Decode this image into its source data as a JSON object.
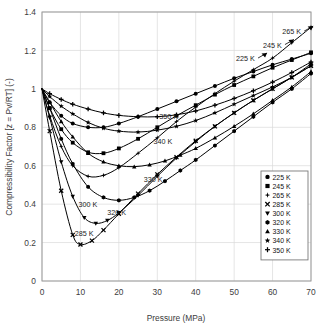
{
  "chart_data": {
    "type": "line",
    "title": "",
    "xlabel": "Pressure (MPa)",
    "ylabel": "Compressibility Factor [z = Pv/RT] (-)",
    "xlim": [
      0,
      70
    ],
    "ylim": [
      0,
      1.4
    ],
    "xticks": [
      "0",
      "10",
      "20",
      "30",
      "40",
      "50",
      "60",
      "70"
    ],
    "xtick_values": [
      0,
      10,
      20,
      30,
      40,
      50,
      60,
      70
    ],
    "yticks": [
      "0",
      "0.2",
      "0.4",
      "0.6",
      "0.8",
      "1",
      "1.2",
      "1.4"
    ],
    "ytick_values": [
      0,
      0.2,
      0.4,
      0.6,
      0.8,
      1.0,
      1.2,
      1.4
    ],
    "grid": true,
    "legend_position": "right-lower",
    "series": [
      {
        "name": "225 K",
        "marker": "circle",
        "x": [
          0,
          2,
          5,
          8,
          12,
          16,
          20,
          25,
          30,
          35,
          40,
          45,
          50,
          55,
          60,
          65,
          70
        ],
        "values": [
          1.0,
          0.93,
          0.86,
          0.82,
          0.8,
          0.8,
          0.82,
          0.855,
          0.895,
          0.935,
          0.975,
          1.015,
          1.055,
          1.09,
          1.125,
          1.155,
          1.185
        ]
      },
      {
        "name": "245 K",
        "marker": "square",
        "x": [
          0,
          2,
          5,
          8,
          12,
          16,
          20,
          25,
          30,
          35,
          40,
          45,
          50,
          55,
          60,
          65,
          70
        ],
        "values": [
          1.0,
          0.9,
          0.79,
          0.72,
          0.67,
          0.665,
          0.69,
          0.74,
          0.8,
          0.86,
          0.915,
          0.97,
          1.02,
          1.065,
          1.11,
          1.15,
          1.19
        ]
      },
      {
        "name": "265 K",
        "marker": "star4",
        "x": [
          0,
          2,
          5,
          8,
          12,
          16,
          20,
          25,
          30,
          35,
          40,
          45,
          50,
          55,
          60,
          65,
          70
        ],
        "values": [
          1.0,
          0.86,
          0.7,
          0.6,
          0.545,
          0.55,
          0.59,
          0.665,
          0.745,
          0.83,
          0.905,
          0.975,
          1.04,
          1.1,
          1.16,
          1.24,
          1.32
        ]
      },
      {
        "name": "285 K",
        "marker": "cross",
        "x": [
          0,
          2,
          5,
          8,
          10,
          13,
          16,
          20,
          25,
          30,
          35,
          40,
          45,
          50,
          55,
          60,
          65,
          70
        ],
        "values": [
          1.0,
          0.78,
          0.47,
          0.24,
          0.19,
          0.21,
          0.265,
          0.35,
          0.455,
          0.555,
          0.645,
          0.73,
          0.805,
          0.875,
          0.94,
          1.0,
          1.06,
          1.12
        ]
      },
      {
        "name": "300 K",
        "marker": "triangle-down",
        "x": [
          0,
          2,
          5,
          8,
          11,
          14,
          17,
          20,
          25,
          30,
          35,
          40,
          45,
          50,
          55,
          60,
          65,
          70
        ],
        "values": [
          1.0,
          0.85,
          0.62,
          0.44,
          0.33,
          0.3,
          0.315,
          0.355,
          0.445,
          0.545,
          0.64,
          0.725,
          0.805,
          0.875,
          0.94,
          1.0,
          1.06,
          1.13
        ]
      },
      {
        "name": "320 K",
        "marker": "hexagon",
        "x": [
          0,
          2,
          5,
          8,
          12,
          16,
          20,
          24,
          28,
          32,
          36,
          40,
          45,
          50,
          55,
          60,
          65,
          70
        ],
        "values": [
          1.0,
          0.9,
          0.74,
          0.61,
          0.49,
          0.435,
          0.42,
          0.435,
          0.47,
          0.52,
          0.575,
          0.63,
          0.705,
          0.78,
          0.855,
          0.93,
          1.0,
          1.08
        ]
      },
      {
        "name": "330 K",
        "marker": "triangle-up",
        "x": [
          0,
          2,
          5,
          8,
          12,
          16,
          20,
          24,
          28,
          32,
          36,
          40,
          45,
          50,
          55,
          60,
          65,
          70
        ],
        "values": [
          1.0,
          0.93,
          0.83,
          0.75,
          0.665,
          0.62,
          0.6,
          0.595,
          0.605,
          0.625,
          0.655,
          0.69,
          0.745,
          0.805,
          0.87,
          0.94,
          1.01,
          1.09
        ]
      },
      {
        "name": "340 K",
        "marker": "star5",
        "x": [
          0,
          2,
          5,
          8,
          12,
          16,
          20,
          25,
          30,
          35,
          40,
          45,
          50,
          55,
          60,
          65,
          70
        ],
        "values": [
          1.0,
          0.96,
          0.91,
          0.87,
          0.825,
          0.795,
          0.78,
          0.775,
          0.785,
          0.805,
          0.835,
          0.875,
          0.92,
          0.965,
          1.01,
          1.06,
          1.12
        ]
      },
      {
        "name": "350 K",
        "marker": "plus",
        "x": [
          0,
          2,
          5,
          8,
          12,
          16,
          20,
          25,
          30,
          35,
          40,
          45,
          50,
          55,
          60,
          65,
          70
        ],
        "values": [
          1.0,
          0.975,
          0.945,
          0.92,
          0.895,
          0.875,
          0.862,
          0.855,
          0.855,
          0.865,
          0.885,
          0.915,
          0.95,
          0.99,
          1.035,
          1.085,
          1.14
        ]
      }
    ],
    "annotations": [
      {
        "label": "265 K",
        "x": 62.5,
        "y": 1.285,
        "leader": true
      },
      {
        "label": "245 K",
        "x": 57.5,
        "y": 1.215,
        "leader": true
      },
      {
        "label": "225 K",
        "x": 50.5,
        "y": 1.145,
        "leader": true
      },
      {
        "label": "350 K",
        "x": 30.5,
        "y": 0.845,
        "leader": false
      },
      {
        "label": "340 K",
        "x": 29.0,
        "y": 0.715,
        "leader": false
      },
      {
        "label": "330 K",
        "x": 26.5,
        "y": 0.515,
        "leader": false
      },
      {
        "label": "300 K",
        "x": 9.5,
        "y": 0.385,
        "leader": false
      },
      {
        "label": "320 K",
        "x": 17.0,
        "y": 0.345,
        "leader": false
      },
      {
        "label": "285 K",
        "x": 8.5,
        "y": 0.235,
        "leader": false
      }
    ],
    "legend_entries": [
      {
        "label": "225 K",
        "marker": "circle"
      },
      {
        "label": "245 K",
        "marker": "square"
      },
      {
        "label": "265 K",
        "marker": "star4"
      },
      {
        "label": "285 K",
        "marker": "cross"
      },
      {
        "label": "300 K",
        "marker": "triangle-down"
      },
      {
        "label": "320 K",
        "marker": "hexagon"
      },
      {
        "label": "330 K",
        "marker": "triangle-up"
      },
      {
        "label": "340 K",
        "marker": "star5"
      },
      {
        "label": "350 K",
        "marker": "plus"
      }
    ]
  },
  "colors": {
    "curve": "#000000",
    "grid": "#d8d8d8",
    "axis": "#8a8a8a",
    "text": "#3d3d3d",
    "background": "#ffffff"
  }
}
